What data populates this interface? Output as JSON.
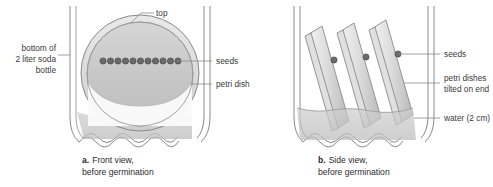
{
  "figure": {
    "background": "#ffffff",
    "outline_color": "#8a8a8a",
    "dish_fill": "#c9c9c9",
    "dish_fill_light": "#e6e6e6",
    "water_fill": "#c2c2c2",
    "seed_color": "#5f5f5f",
    "text_color": "#333333"
  },
  "panel_a": {
    "caption_letter": "a.",
    "caption_line1": "Front view,",
    "caption_line2": "before germination",
    "labels": {
      "top": "top",
      "bottle_line1": "bottom of",
      "bottle_line2": "2 liter soda",
      "bottle_line3": "bottle",
      "seeds": "seeds",
      "petri_dish": "petri dish"
    },
    "seed_count": 11
  },
  "panel_b": {
    "caption_letter": "b.",
    "caption_line1": "Side view,",
    "caption_line2": "before germination",
    "labels": {
      "seeds": "seeds",
      "dishes_line1": "petri dishes",
      "dishes_line2": "tilted on end",
      "water": "water (2 cm)"
    },
    "dish_count": 3,
    "seed_count": 3
  }
}
